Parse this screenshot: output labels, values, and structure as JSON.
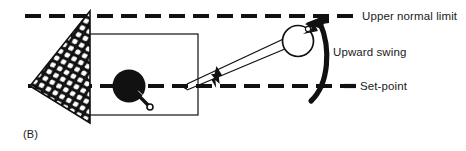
{
  "figure": {
    "panel_label": "(B)",
    "width": 466,
    "height": 151,
    "background_color": "#ffffff",
    "ink_color": "#111111"
  },
  "labels": {
    "upper_normal_limit": "Upper normal limit",
    "upward_swing": "Upward swing",
    "set_point": "Set-point"
  },
  "diagram": {
    "type": "schematic",
    "lines": {
      "upper_normal_limit_y": 16,
      "set_point_y": 86,
      "dash_length": 16,
      "dash_gap": 8,
      "dash_thickness": 4
    },
    "elements": [
      {
        "name": "mesh-wedge",
        "shape": "triangle",
        "fill": "net-hatch",
        "apex": [
          30,
          86
        ],
        "top": [
          90,
          12
        ],
        "bottom": [
          90,
          122
        ]
      },
      {
        "name": "frame-rectangle",
        "shape": "rectangle",
        "x": 78,
        "y": 34,
        "width": 120,
        "height": 81
      },
      {
        "name": "set-point-ball",
        "shape": "filled-circle",
        "cx": 129,
        "cy": 86,
        "r": 16
      },
      {
        "name": "ball-pointer",
        "shape": "small-tail",
        "from": [
          137,
          94
        ],
        "to": [
          149,
          107
        ]
      },
      {
        "name": "pendulum-rod",
        "shape": "double-line",
        "from": [
          188,
          86
        ],
        "to": [
          293,
          41
        ]
      },
      {
        "name": "pendulum-bob",
        "shape": "open-circle",
        "cx": 298,
        "cy": 41,
        "r": 15
      },
      {
        "name": "upward-arrow-small",
        "shape": "arrow",
        "at": [
          217,
          86
        ],
        "direction": "up"
      },
      {
        "name": "upward-swing-arc",
        "shape": "curved-arrow",
        "from": [
          312,
          100
        ],
        "to": [
          322,
          20
        ],
        "direction": "up"
      }
    ]
  }
}
